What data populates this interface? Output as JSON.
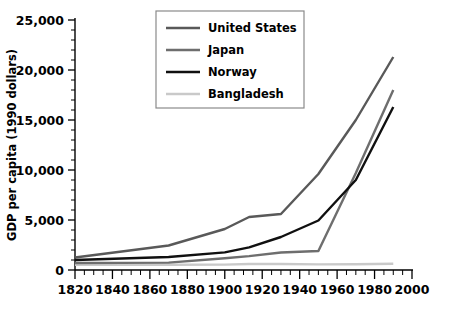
{
  "chart_data": {
    "type": "line",
    "title": "",
    "xlabel": "",
    "ylabel": "GDP per capita (1990 dollars)",
    "xlim": [
      1820,
      2000
    ],
    "ylim": [
      0,
      25000
    ],
    "grid": false,
    "legend_position": "top-left-inside",
    "x_ticks": [
      1820,
      1840,
      1860,
      1880,
      1900,
      1920,
      1940,
      1960,
      1980,
      2000
    ],
    "x_tick_labels": [
      "1820",
      "1840",
      "1860",
      "1880",
      "1900",
      "1920",
      "1940",
      "1960",
      "1980",
      "2000"
    ],
    "x_minor_step": 5,
    "y_ticks": [
      0,
      5000,
      10000,
      15000,
      20000,
      25000
    ],
    "y_tick_labels": [
      "0",
      "5,000",
      "10,000",
      "15,000",
      "20,000",
      "25,000"
    ],
    "y_minor_step": 1000,
    "series": [
      {
        "name": "United States",
        "color": "#595959",
        "width": 2.4,
        "x": [
          1820,
          1870,
          1900,
          1913,
          1930,
          1950,
          1970,
          1990
        ],
        "values": [
          1250,
          2450,
          4100,
          5300,
          5600,
          9600,
          15000,
          21300
        ]
      },
      {
        "name": "Japan",
        "color": "#6e6e6e",
        "width": 2.4,
        "x": [
          1820,
          1870,
          1900,
          1913,
          1930,
          1950,
          1970,
          1990
        ],
        "values": [
          700,
          740,
          1180,
          1390,
          1750,
          1900,
          9700,
          18000
        ]
      },
      {
        "name": "Norway",
        "color": "#101010",
        "width": 2.4,
        "x": [
          1820,
          1870,
          1900,
          1913,
          1930,
          1950,
          1970,
          1990
        ],
        "values": [
          1000,
          1300,
          1760,
          2270,
          3300,
          4950,
          9000,
          16300
        ]
      },
      {
        "name": "Bangladesh",
        "color": "#c9c9c9",
        "width": 2.4,
        "x": [
          1820,
          1870,
          1900,
          1913,
          1930,
          1950,
          1970,
          1990
        ],
        "values": [
          530,
          520,
          540,
          600,
          600,
          560,
          580,
          620
        ]
      }
    ]
  },
  "legend": {
    "entries": [
      {
        "label": "United States",
        "color": "#595959"
      },
      {
        "label": "Japan",
        "color": "#6e6e6e"
      },
      {
        "label": "Norway",
        "color": "#101010"
      },
      {
        "label": "Bangladesh",
        "color": "#c9c9c9"
      }
    ]
  }
}
